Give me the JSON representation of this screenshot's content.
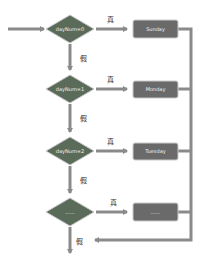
{
  "colors": {
    "diamond": "#5a6b5a",
    "box": "#6a6a6a",
    "arrow": "#8a8a8a",
    "edge": "#c9c9c9"
  },
  "start_arrow": "",
  "branches": [
    {
      "condition": "dayNum=0",
      "true_label": "真",
      "false_label": "假",
      "action": "Sunday"
    },
    {
      "condition": "dayNum=1",
      "true_label": "真",
      "false_label": "假",
      "action": "Monday"
    },
    {
      "condition": "dayNum=2",
      "true_label": "真",
      "false_label": "假",
      "action": "Tuesday"
    },
    {
      "condition": "......",
      "true_label": "真",
      "false_label": "假",
      "action": "......"
    }
  ]
}
